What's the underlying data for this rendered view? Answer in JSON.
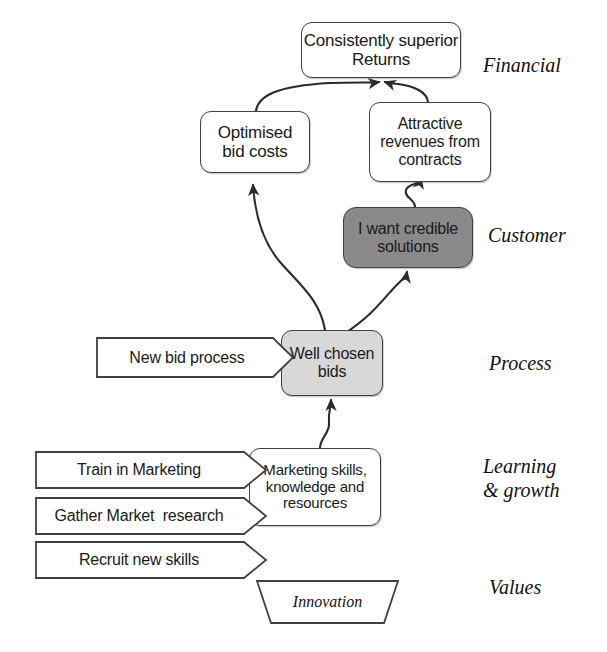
{
  "diagram": {
    "colors": {
      "outline": "#404040",
      "white_fill": "#ffffff",
      "light_gray_fill": "#d8d8d8",
      "dark_gray_fill": "#8a8a8a",
      "text": "#1a1a1a",
      "background": "#ffffff"
    },
    "perspectives": [
      {
        "id": "financial",
        "label": "Financial"
      },
      {
        "id": "customer",
        "label": "Customer"
      },
      {
        "id": "process",
        "label": "Process"
      },
      {
        "id": "learning",
        "label": "Learning\n& growth"
      },
      {
        "id": "values",
        "label": "Values"
      }
    ],
    "objectives": [
      {
        "id": "consistently-superior-returns",
        "label": "Consistently superior\nReturns",
        "perspective": "financial",
        "shape": "rounded-rectangle",
        "fill": "white",
        "x": 301,
        "y": 22,
        "w": 160,
        "h": 56,
        "font_size": 17
      },
      {
        "id": "optimised-bid-costs",
        "label": "Optimised\nbid costs",
        "perspective": "financial",
        "shape": "rounded-rectangle",
        "fill": "white",
        "x": 200,
        "y": 111,
        "w": 110,
        "h": 62,
        "font_size": 17
      },
      {
        "id": "attractive-revenues-from-contracts",
        "label": "Attractive\nrevenues from\ncontracts",
        "perspective": "financial",
        "shape": "rounded-rectangle",
        "fill": "white",
        "x": 369,
        "y": 102,
        "w": 122,
        "h": 80,
        "font_size": 16
      },
      {
        "id": "i-want-credible-solutions",
        "label": "I want credible\nsolutions",
        "perspective": "customer",
        "shape": "rounded-rectangle",
        "fill": "dark-gray",
        "x": 343,
        "y": 207,
        "w": 130,
        "h": 61,
        "font_size": 16
      },
      {
        "id": "well-chosen-bids",
        "label": "Well chosen\nbids",
        "perspective": "process",
        "shape": "rounded-rectangle",
        "fill": "light-gray",
        "x": 281,
        "y": 330,
        "w": 102,
        "h": 66,
        "font_size": 16
      },
      {
        "id": "marketing-skills-knowledge-resources",
        "label": "Marketing skills,\nknowledge and\nresources",
        "perspective": "learning",
        "shape": "rounded-rectangle",
        "fill": "white",
        "x": 249,
        "y": 448,
        "w": 132,
        "h": 78,
        "font_size": 15
      }
    ],
    "initiatives": [
      {
        "id": "new-bid-process",
        "label": "New bid process",
        "perspective": "process",
        "shape": "chevron-arrow",
        "x": 96,
        "y": 337,
        "w": 198,
        "h": 41,
        "tip": 20,
        "font_size": 16
      },
      {
        "id": "train-in-marketing",
        "label": "Train in Marketing",
        "perspective": "learning",
        "shape": "chevron-arrow",
        "x": 35,
        "y": 451,
        "w": 232,
        "h": 38,
        "tip": 22,
        "font_size": 16
      },
      {
        "id": "gather-market-research",
        "label": "Gather Market  research",
        "perspective": "learning",
        "shape": "chevron-arrow",
        "x": 35,
        "y": 497,
        "w": 232,
        "h": 38,
        "tip": 22,
        "font_size": 16
      },
      {
        "id": "recruit-new-skills",
        "label": "Recruit new skills",
        "perspective": "learning",
        "shape": "chevron-arrow",
        "x": 35,
        "y": 541,
        "w": 232,
        "h": 38,
        "tip": 22,
        "font_size": 16
      }
    ],
    "values_shape": {
      "id": "innovation",
      "label": "Innovation",
      "perspective": "values",
      "shape": "inverted-trapezoid",
      "x": 256,
      "y": 580,
      "w": 143,
      "h": 44,
      "font_size": 16
    },
    "connections": [
      {
        "from": "optimised-bid-costs",
        "to": "consistently-superior-returns",
        "style": "curved-arrow"
      },
      {
        "from": "attractive-revenues-from-contracts",
        "to": "consistently-superior-returns",
        "style": "curved-arrow"
      },
      {
        "from": "i-want-credible-solutions",
        "to": "attractive-revenues-from-contracts",
        "style": "wavy-arrow"
      },
      {
        "from": "well-chosen-bids",
        "to": "optimised-bid-costs",
        "style": "long-s-curve-arrow"
      },
      {
        "from": "well-chosen-bids",
        "to": "i-want-credible-solutions",
        "style": "curved-arrow"
      },
      {
        "from": "marketing-skills-knowledge-resources",
        "to": "well-chosen-bids",
        "style": "wavy-arrow"
      }
    ]
  },
  "perspective_positions": {
    "financial": {
      "x": 483,
      "y": 54
    },
    "customer": {
      "x": 488,
      "y": 224
    },
    "process": {
      "x": 489,
      "y": 352
    },
    "learning": {
      "x": 483,
      "y": 455
    },
    "values": {
      "x": 489,
      "y": 576
    }
  }
}
